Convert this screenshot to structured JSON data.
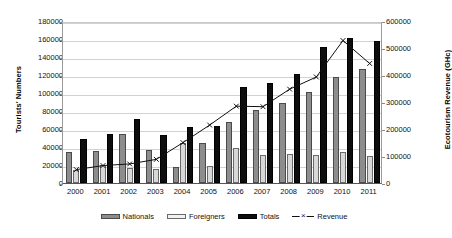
{
  "chart_data": {
    "type": "bar",
    "title": "",
    "subtitle": "",
    "xlabel": "",
    "ylabel": "Tourists' Numbers",
    "y2label": "Ecotourism Revenue (GHc)",
    "categories": [
      "2000",
      "2001",
      "2002",
      "2003",
      "2004",
      "2005",
      "2006",
      "2007",
      "2008",
      "2009",
      "2010",
      "2011"
    ],
    "ylim": [
      0,
      180000
    ],
    "ytick_step": 20000,
    "yticks": [
      "0",
      "20000",
      "40000",
      "60000",
      "80000",
      "100000",
      "120000",
      "140000",
      "160000",
      "180000"
    ],
    "y2lim": [
      0,
      600000
    ],
    "y2tick_step": 100000,
    "y2ticks": [
      "0",
      "100000",
      "200000",
      "300000",
      "400000",
      "500000",
      "600000"
    ],
    "grid": true,
    "legend_position": "bottom",
    "series": [
      {
        "name": "Nationals",
        "kind": "bar",
        "axis": "left",
        "color": "#8d8d8d",
        "values": [
          34000,
          35500,
          54000,
          36500,
          18000,
          44500,
          68000,
          81000,
          88500,
          101000,
          118000,
          127000
        ]
      },
      {
        "name": "Foreigners",
        "kind": "bar",
        "axis": "left",
        "color": "#d8d8d8",
        "values": [
          15000,
          19500,
          17000,
          16000,
          44500,
          19000,
          38500,
          31000,
          32500,
          31500,
          34500,
          30500
        ]
      },
      {
        "name": "Totals",
        "kind": "bar",
        "axis": "left",
        "color": "#0d0d0d",
        "values": [
          49000,
          55000,
          71000,
          53000,
          62500,
          63500,
          106500,
          111000,
          121000,
          151000,
          161000,
          158000
        ]
      },
      {
        "name": "Revenue",
        "kind": "line",
        "axis": "right",
        "color": "#111111",
        "marker": "x",
        "values": [
          57000,
          72000,
          78000,
          95000,
          157000,
          222000,
          292000,
          290000,
          355000,
          400000,
          535000,
          450000
        ]
      }
    ]
  },
  "legend": {
    "items": [
      {
        "label": "Nationals",
        "icon": "bar-swatch-dark-gray"
      },
      {
        "label": "Foreigners",
        "icon": "bar-swatch-light-gray"
      },
      {
        "label": "Totals",
        "icon": "bar-swatch-black"
      },
      {
        "label": "Revenue",
        "icon": "line-x-marker"
      }
    ]
  },
  "colors": {
    "nationals": "#8d8d8d",
    "foreigners": "#d8d8d8",
    "totals": "#0d0d0d",
    "revenue": "#111111",
    "grid": "#d2d2d2",
    "background": "#ffffff"
  }
}
